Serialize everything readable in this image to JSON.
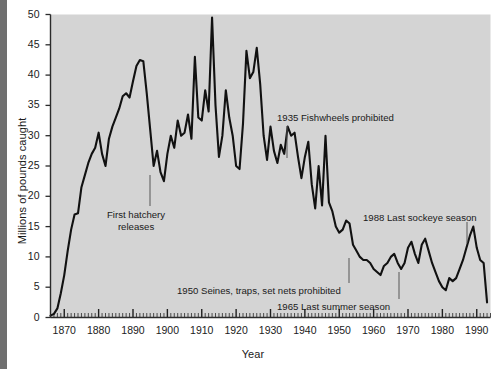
{
  "figure": {
    "plot_bg": "#d4d4d4",
    "line_color": "#111111",
    "text_color": "#1b1b1b",
    "scan_edge_color": "#6f6f6f"
  },
  "chart_data": {
    "type": "line",
    "title": "",
    "xlabel": "Year",
    "ylabel": "Millions of pounds caught",
    "xlim": [
      1866,
      1994
    ],
    "ylim": [
      0,
      50
    ],
    "grid": false,
    "legend": null,
    "y_ticks": [
      0,
      5,
      10,
      15,
      20,
      25,
      30,
      35,
      40,
      45,
      50
    ],
    "y_tick_labels": [
      "0",
      "5",
      "10",
      "15",
      "20",
      "25",
      "30",
      "35",
      "40",
      "45",
      "50"
    ],
    "x_ticks": [
      1870,
      1880,
      1890,
      1900,
      1910,
      1920,
      1930,
      1940,
      1950,
      1960,
      1970,
      1980,
      1990
    ],
    "x_tick_labels": [
      "1870",
      "1880",
      "1890",
      "1900",
      "1910",
      "1920",
      "1930",
      "1940",
      "1950",
      "1960",
      "1970",
      "1980",
      "1990"
    ],
    "minor_x_tick_interval": 1,
    "x": [
      1866,
      1867,
      1868,
      1869,
      1870,
      1871,
      1872,
      1873,
      1874,
      1875,
      1876,
      1877,
      1878,
      1879,
      1880,
      1881,
      1882,
      1883,
      1884,
      1885,
      1886,
      1887,
      1888,
      1889,
      1890,
      1891,
      1892,
      1893,
      1894,
      1895,
      1896,
      1897,
      1898,
      1899,
      1900,
      1901,
      1902,
      1903,
      1904,
      1905,
      1906,
      1907,
      1908,
      1909,
      1910,
      1911,
      1912,
      1913,
      1914,
      1915,
      1916,
      1917,
      1918,
      1919,
      1920,
      1921,
      1922,
      1923,
      1924,
      1925,
      1926,
      1927,
      1928,
      1929,
      1930,
      1931,
      1932,
      1933,
      1934,
      1935,
      1936,
      1937,
      1938,
      1939,
      1940,
      1941,
      1942,
      1943,
      1944,
      1945,
      1946,
      1947,
      1948,
      1949,
      1950,
      1951,
      1952,
      1953,
      1954,
      1955,
      1956,
      1957,
      1958,
      1959,
      1960,
      1961,
      1962,
      1963,
      1964,
      1965,
      1966,
      1967,
      1968,
      1969,
      1970,
      1971,
      1972,
      1973,
      1974,
      1975,
      1976,
      1977,
      1978,
      1979,
      1980,
      1981,
      1982,
      1983,
      1984,
      1985,
      1986,
      1987,
      1988,
      1989,
      1990,
      1991,
      1992,
      1993
    ],
    "y": [
      0.3,
      0.6,
      1.5,
      4.0,
      7.0,
      11.0,
      14.5,
      17.0,
      17.2,
      21.5,
      23.5,
      25.5,
      27.0,
      28.0,
      30.5,
      27.0,
      25.0,
      29.5,
      31.5,
      33.0,
      34.5,
      36.5,
      37.0,
      36.3,
      39.0,
      41.5,
      42.5,
      42.3,
      37.0,
      31.0,
      25.0,
      27.5,
      24.0,
      22.5,
      27.0,
      30.0,
      28.0,
      32.5,
      30.0,
      30.5,
      33.5,
      29.5,
      43.0,
      33.0,
      32.5,
      37.5,
      34.0,
      49.5,
      35.0,
      26.5,
      30.0,
      37.5,
      33.0,
      30.0,
      25.0,
      24.5,
      32.0,
      44.0,
      39.5,
      40.5,
      44.5,
      38.5,
      30.0,
      26.0,
      31.5,
      27.5,
      25.5,
      28.5,
      27.0,
      31.5,
      30.0,
      30.5,
      26.5,
      23.0,
      26.5,
      29.0,
      22.0,
      18.0,
      25.0,
      18.5,
      30.0,
      19.0,
      17.5,
      15.0,
      14.0,
      14.5,
      16.0,
      15.5,
      12.0,
      11.0,
      10.0,
      9.5,
      9.5,
      9.0,
      8.0,
      7.5,
      7.0,
      8.5,
      9.0,
      10.0,
      10.5,
      9.0,
      8.0,
      9.0,
      11.5,
      12.5,
      10.5,
      9.0,
      12.0,
      13.0,
      11.0,
      9.0,
      7.5,
      6.0,
      5.0,
      4.5,
      6.5,
      6.0,
      6.5,
      8.0,
      9.5,
      11.5,
      13.5,
      15.0,
      11.5,
      9.5,
      9.0,
      2.5
    ]
  },
  "annotations": [
    {
      "id": "first-hatchery-releases",
      "lines": [
        "First hatchery",
        "releases"
      ],
      "text": "First hatchery releases",
      "year": 1893,
      "label_x": 107,
      "label_y": 209,
      "leader_x": 150,
      "leader_y1": 175,
      "leader_y2": 206,
      "align": "center"
    },
    {
      "id": "fishwheels-prohibited",
      "lines": [
        "1935 Fishwheels prohibited"
      ],
      "text": "1935 Fishwheels prohibited",
      "year": 1935,
      "label_x": 277,
      "label_y": 112,
      "leader_x": 287,
      "leader_y1": 126,
      "leader_y2": 158,
      "align": "left"
    },
    {
      "id": "seines-traps-set-nets-prohibited",
      "lines": [
        "1950 Seines, traps, set nets prohibited"
      ],
      "text": "1950 Seines, traps, set nets prohibited",
      "year": 1950,
      "label_x": 177,
      "label_y": 285,
      "leader_x": 349,
      "leader_y1": 258,
      "leader_y2": 283,
      "align": "left"
    },
    {
      "id": "last-summer-season",
      "lines": [
        "1965 Last summer season"
      ],
      "text": "1965 Last summer season",
      "year": 1965,
      "label_x": 277,
      "label_y": 301,
      "leader_x": 399,
      "leader_y1": 272,
      "leader_y2": 299,
      "align": "left"
    },
    {
      "id": "last-sockeye-season",
      "lines": [
        "1988 Last sockeye season"
      ],
      "text": "1988 Last sockeye season",
      "year": 1988,
      "label_x": 363,
      "label_y": 212,
      "leader_x": 467,
      "leader_y1": 222,
      "leader_y2": 243,
      "align": "left"
    }
  ]
}
